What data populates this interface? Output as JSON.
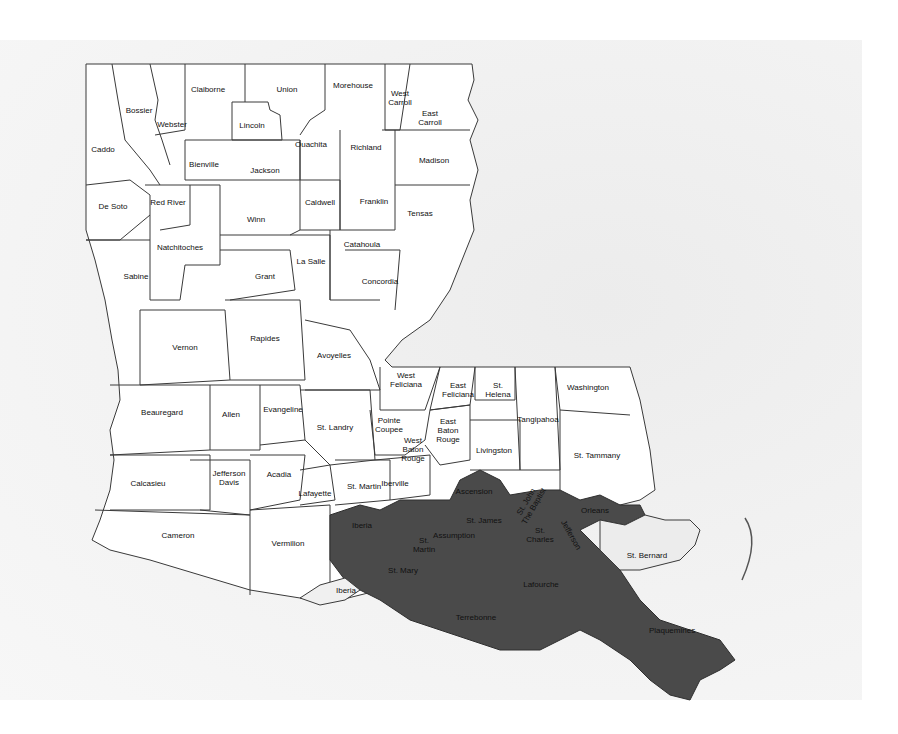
{
  "map": {
    "title": "",
    "subject": "Louisiana parishes",
    "highlight_color": "#4a4a4a",
    "base_color": "#ffffff",
    "highlighted_parishes": [
      "Ascension",
      "St. James",
      "St. John The Baptist",
      "St. Charles",
      "Jefferson",
      "Orleans",
      "Assumption",
      "St. Martin (south)",
      "Iberia (north)",
      "St. Mary",
      "Lafourche",
      "Terrebonne",
      "Plaquemines"
    ],
    "parishes": [
      {
        "name": "Caddo",
        "x": 103,
        "y": 149
      },
      {
        "name": "Bossier",
        "x": 139,
        "y": 110
      },
      {
        "name": "Webster",
        "x": 172,
        "y": 124
      },
      {
        "name": "Claiborne",
        "x": 208,
        "y": 89
      },
      {
        "name": "Union",
        "x": 287,
        "y": 89
      },
      {
        "name": "Morehouse",
        "x": 353,
        "y": 85
      },
      {
        "name": "West\nCarroll",
        "x": 400,
        "y": 98
      },
      {
        "name": "East\nCarroll",
        "x": 430,
        "y": 118
      },
      {
        "name": "Lincoln",
        "x": 252,
        "y": 125
      },
      {
        "name": "Bienville",
        "x": 204,
        "y": 164
      },
      {
        "name": "Jackson",
        "x": 265,
        "y": 170
      },
      {
        "name": "Ouachita",
        "x": 311,
        "y": 144
      },
      {
        "name": "Richland",
        "x": 366,
        "y": 147
      },
      {
        "name": "Madison",
        "x": 434,
        "y": 160
      },
      {
        "name": "Franklin",
        "x": 374,
        "y": 201
      },
      {
        "name": "Tensas",
        "x": 420,
        "y": 213
      },
      {
        "name": "Caldwell",
        "x": 320,
        "y": 202
      },
      {
        "name": "De Soto",
        "x": 113,
        "y": 206
      },
      {
        "name": "Red River",
        "x": 168,
        "y": 202
      },
      {
        "name": "Winn",
        "x": 256,
        "y": 219
      },
      {
        "name": "Natchitoches",
        "x": 180,
        "y": 247
      },
      {
        "name": "Sabine",
        "x": 136,
        "y": 276
      },
      {
        "name": "Grant",
        "x": 265,
        "y": 276
      },
      {
        "name": "La Salle",
        "x": 311,
        "y": 261
      },
      {
        "name": "Catahoula",
        "x": 362,
        "y": 244
      },
      {
        "name": "Concordia",
        "x": 380,
        "y": 281
      },
      {
        "name": "Vernon",
        "x": 185,
        "y": 347
      },
      {
        "name": "Rapides",
        "x": 265,
        "y": 338
      },
      {
        "name": "Avoyelles",
        "x": 334,
        "y": 355
      },
      {
        "name": "Beauregard",
        "x": 162,
        "y": 412
      },
      {
        "name": "Allen",
        "x": 231,
        "y": 414
      },
      {
        "name": "Evangeline",
        "x": 283,
        "y": 409
      },
      {
        "name": "St. Landry",
        "x": 335,
        "y": 427
      },
      {
        "name": "West\nFeliciana",
        "x": 406,
        "y": 380
      },
      {
        "name": "East\nFeliciana",
        "x": 458,
        "y": 390
      },
      {
        "name": "St.\nHelena",
        "x": 498,
        "y": 390
      },
      {
        "name": "Washington",
        "x": 588,
        "y": 387
      },
      {
        "name": "Pointe\nCoupee",
        "x": 389,
        "y": 425
      },
      {
        "name": "East\nBaton\nRouge",
        "x": 448,
        "y": 430
      },
      {
        "name": "West\nBaton\nRouge",
        "x": 413,
        "y": 449
      },
      {
        "name": "Tangipahoa",
        "x": 538,
        "y": 419
      },
      {
        "name": "Livingston",
        "x": 494,
        "y": 450
      },
      {
        "name": "St. Tammany",
        "x": 597,
        "y": 455
      },
      {
        "name": "Calcasieu",
        "x": 148,
        "y": 483
      },
      {
        "name": "Jefferson\nDavis",
        "x": 229,
        "y": 478
      },
      {
        "name": "Acadia",
        "x": 279,
        "y": 474
      },
      {
        "name": "Lafayette",
        "x": 315,
        "y": 493
      },
      {
        "name": "St. Martin",
        "x": 364,
        "y": 486
      },
      {
        "name": "Iberville",
        "x": 395,
        "y": 483
      },
      {
        "name": "Cameron",
        "x": 178,
        "y": 535
      },
      {
        "name": "Vermilion",
        "x": 288,
        "y": 543
      },
      {
        "name": "Iberia",
        "x": 346,
        "y": 590
      },
      {
        "name": "St. Bernard",
        "x": 647,
        "y": 555
      },
      {
        "name": "Iberia",
        "x": 362,
        "y": 525,
        "dark": true
      },
      {
        "name": "Ascension",
        "x": 474,
        "y": 491,
        "dark": true
      },
      {
        "name": "St. James",
        "x": 484,
        "y": 520,
        "dark": true
      },
      {
        "name": "St. John\nThe Baptist",
        "x": 530,
        "y": 504,
        "dark": true,
        "rot": true
      },
      {
        "name": "Assumption",
        "x": 454,
        "y": 535,
        "dark": true
      },
      {
        "name": "St.\nMartin",
        "x": 424,
        "y": 545,
        "dark": true
      },
      {
        "name": "St.\nCharles",
        "x": 540,
        "y": 535,
        "dark": true
      },
      {
        "name": "Jefferson",
        "x": 571,
        "y": 535,
        "dark": true,
        "rot2": true
      },
      {
        "name": "Orleans",
        "x": 595,
        "y": 510,
        "dark": true
      },
      {
        "name": "St. Mary",
        "x": 403,
        "y": 570,
        "dark": true
      },
      {
        "name": "Lafourche",
        "x": 541,
        "y": 584,
        "dark": true
      },
      {
        "name": "Terrebonne",
        "x": 476,
        "y": 617,
        "dark": true
      },
      {
        "name": "Plaquemines",
        "x": 672,
        "y": 630,
        "dark": true
      }
    ]
  }
}
